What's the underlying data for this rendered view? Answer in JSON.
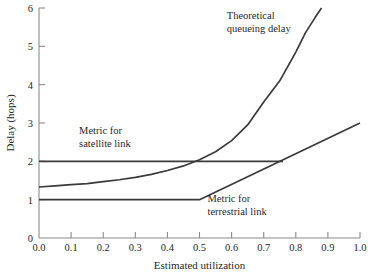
{
  "chart_data": {
    "type": "line",
    "title": "",
    "xlabel": "Estimated utilization",
    "ylabel": "Delay (hops)",
    "xlim": [
      0.0,
      1.0
    ],
    "ylim": [
      0,
      6
    ],
    "grid": false,
    "legend_position": "inline-annotations",
    "xticks": [
      "0.0",
      "0.1",
      "0.2",
      "0.3",
      "0.4",
      "0.5",
      "0.6",
      "0.7",
      "0.8",
      "0.9",
      "1.0"
    ],
    "xtick_values": [
      0.0,
      0.1,
      0.2,
      0.3,
      0.4,
      0.5,
      0.6,
      0.7,
      0.8,
      0.9,
      1.0
    ],
    "yticks": [
      "0",
      "1",
      "2",
      "3",
      "4",
      "5",
      "6"
    ],
    "ytick_values": [
      0,
      1,
      2,
      3,
      4,
      5,
      6
    ],
    "series": [
      {
        "name": "Theoretical queueing delay",
        "x": [
          0.0,
          0.05,
          0.1,
          0.15,
          0.2,
          0.25,
          0.3,
          0.35,
          0.4,
          0.45,
          0.5,
          0.55,
          0.6,
          0.65,
          0.7,
          0.75,
          0.8,
          0.83,
          0.86,
          0.88
        ],
        "values": [
          1.33,
          1.36,
          1.39,
          1.42,
          1.47,
          1.52,
          1.58,
          1.66,
          1.76,
          1.88,
          2.04,
          2.25,
          2.54,
          2.95,
          3.55,
          4.1,
          4.85,
          5.35,
          5.75,
          6.0
        ]
      },
      {
        "name": "Metric for satellite link",
        "x": [
          0.0,
          0.76
        ],
        "values": [
          2.0,
          2.0
        ]
      },
      {
        "name": "Metric for terrestrial link",
        "x": [
          0.0,
          0.5,
          1.0
        ],
        "values": [
          1.0,
          1.0,
          3.0
        ]
      }
    ],
    "annotations": [
      {
        "id": "theoretical-queueing-delay",
        "line1": "Theoretical",
        "line2": "queueing delay",
        "x": 0.585,
        "y": 5.72
      },
      {
        "id": "metric-satellite-link",
        "line1": "Metric for",
        "line2": "satellite link",
        "x": 0.125,
        "y": 2.72
      },
      {
        "id": "metric-terrestrial-link",
        "line1": "Metric for",
        "line2": "terrestrial link",
        "x": 0.525,
        "y": 0.95
      }
    ],
    "colors": {
      "curve": "#3a3a3a",
      "axis": "#8a8a8a",
      "text": "#1f1f1f",
      "background": "#ffffff"
    }
  }
}
